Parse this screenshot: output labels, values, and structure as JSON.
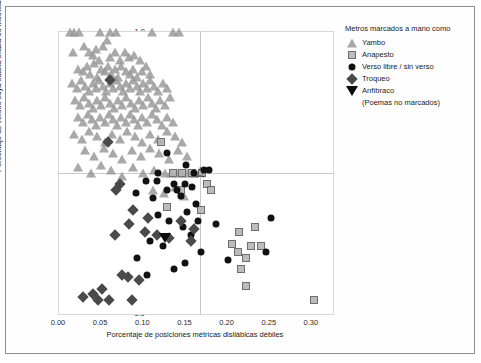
{
  "figure": {
    "background": "#ffffff",
    "frame_color": "#8c8c8c"
  },
  "legend": {
    "title": "Metros marcados a mano como",
    "note": "(Poemas no marcados)",
    "entries": [
      {
        "label": "Yambo",
        "marker": "triangle-up",
        "color": "#969696"
      },
      {
        "label": "Anapesto",
        "marker": "square",
        "color": "#b0b0b0"
      },
      {
        "label": "Verso libre / sin verso",
        "marker": "circle",
        "color": "#111111"
      },
      {
        "label": "Troqueo",
        "marker": "diamond",
        "color": "#4a4a4a"
      },
      {
        "label": "Anfíbraco",
        "marker": "triangle-down",
        "color": "#0c0c0c"
      }
    ]
  },
  "chart_data": {
    "type": "scatter",
    "title": "",
    "xlabel": "Porcentaje de posiciones métricas disilábicas débiles",
    "ylabel": "Porcentaje de versos cuya cuarta sílaba es métricamente fuerte",
    "xlim": [
      0.0,
      0.325
    ],
    "ylim": [
      0.0,
      1.0
    ],
    "xticks": [
      "0.00",
      "0.05",
      "0.10",
      "0.15",
      "0.20",
      "0.25",
      "0.30"
    ],
    "xtick_values": [
      0.0,
      0.05,
      0.1,
      0.15,
      0.2,
      0.25,
      0.3
    ],
    "yticks": [
      "0.0",
      "0.1",
      "0.2",
      "0.3",
      "0.4",
      "0.5",
      "0.6",
      "0.7",
      "0.8",
      "0.9",
      "1.0"
    ],
    "ytick_values": [
      0.0,
      0.1,
      0.2,
      0.3,
      0.4,
      0.5,
      0.6,
      0.7,
      0.8,
      0.9,
      1.0
    ],
    "grid": false,
    "legend_position": "right-outside",
    "reference_lines": {
      "x": 0.167,
      "y": 0.5,
      "color": "#c9c9c9"
    },
    "highlight_marker": {
      "shape": "star",
      "x": 0.167,
      "y": 0.5
    },
    "series": [
      {
        "name": "Yambo",
        "marker": "triangle-up",
        "color": "#969696",
        "points": [
          [
            0.013,
            1.0
          ],
          [
            0.018,
            1.0
          ],
          [
            0.024,
            1.0
          ],
          [
            0.049,
            1.0
          ],
          [
            0.061,
            1.0
          ],
          [
            0.068,
            1.0
          ],
          [
            0.11,
            1.0
          ],
          [
            0.135,
            1.0
          ],
          [
            0.142,
            1.0
          ],
          [
            0.017,
            0.93
          ],
          [
            0.03,
            0.95
          ],
          [
            0.035,
            0.93
          ],
          [
            0.04,
            0.92
          ],
          [
            0.044,
            0.94
          ],
          [
            0.048,
            0.9
          ],
          [
            0.052,
            0.95
          ],
          [
            0.057,
            0.97
          ],
          [
            0.06,
            0.91
          ],
          [
            0.066,
            0.93
          ],
          [
            0.072,
            0.9
          ],
          [
            0.078,
            0.93
          ],
          [
            0.083,
            0.91
          ],
          [
            0.089,
            0.92
          ],
          [
            0.096,
            0.9
          ],
          [
            0.022,
            0.87
          ],
          [
            0.028,
            0.86
          ],
          [
            0.033,
            0.88
          ],
          [
            0.037,
            0.85
          ],
          [
            0.041,
            0.89
          ],
          [
            0.045,
            0.84
          ],
          [
            0.05,
            0.87
          ],
          [
            0.054,
            0.86
          ],
          [
            0.058,
            0.88
          ],
          [
            0.062,
            0.85
          ],
          [
            0.066,
            0.87
          ],
          [
            0.07,
            0.84
          ],
          [
            0.074,
            0.88
          ],
          [
            0.079,
            0.86
          ],
          [
            0.084,
            0.85
          ],
          [
            0.088,
            0.87
          ],
          [
            0.093,
            0.84
          ],
          [
            0.098,
            0.86
          ],
          [
            0.103,
            0.88
          ],
          [
            0.108,
            0.85
          ],
          [
            0.015,
            0.82
          ],
          [
            0.021,
            0.8
          ],
          [
            0.026,
            0.83
          ],
          [
            0.031,
            0.81
          ],
          [
            0.036,
            0.79
          ],
          [
            0.04,
            0.82
          ],
          [
            0.044,
            0.8
          ],
          [
            0.048,
            0.83
          ],
          [
            0.052,
            0.81
          ],
          [
            0.056,
            0.79
          ],
          [
            0.06,
            0.82
          ],
          [
            0.064,
            0.8
          ],
          [
            0.068,
            0.83
          ],
          [
            0.072,
            0.81
          ],
          [
            0.076,
            0.79
          ],
          [
            0.08,
            0.82
          ],
          [
            0.084,
            0.8
          ],
          [
            0.088,
            0.83
          ],
          [
            0.092,
            0.81
          ],
          [
            0.096,
            0.79
          ],
          [
            0.1,
            0.82
          ],
          [
            0.104,
            0.8
          ],
          [
            0.108,
            0.83
          ],
          [
            0.113,
            0.81
          ],
          [
            0.118,
            0.79
          ],
          [
            0.123,
            0.82
          ],
          [
            0.128,
            0.8
          ],
          [
            0.019,
            0.76
          ],
          [
            0.025,
            0.74
          ],
          [
            0.03,
            0.77
          ],
          [
            0.035,
            0.75
          ],
          [
            0.04,
            0.73
          ],
          [
            0.045,
            0.76
          ],
          [
            0.05,
            0.74
          ],
          [
            0.055,
            0.77
          ],
          [
            0.06,
            0.75
          ],
          [
            0.065,
            0.73
          ],
          [
            0.07,
            0.76
          ],
          [
            0.075,
            0.74
          ],
          [
            0.08,
            0.77
          ],
          [
            0.085,
            0.75
          ],
          [
            0.09,
            0.73
          ],
          [
            0.095,
            0.76
          ],
          [
            0.1,
            0.74
          ],
          [
            0.105,
            0.77
          ],
          [
            0.11,
            0.75
          ],
          [
            0.115,
            0.73
          ],
          [
            0.12,
            0.76
          ],
          [
            0.126,
            0.74
          ],
          [
            0.132,
            0.77
          ],
          [
            0.023,
            0.7
          ],
          [
            0.029,
            0.68
          ],
          [
            0.034,
            0.71
          ],
          [
            0.039,
            0.69
          ],
          [
            0.044,
            0.67
          ],
          [
            0.049,
            0.7
          ],
          [
            0.054,
            0.68
          ],
          [
            0.059,
            0.71
          ],
          [
            0.064,
            0.69
          ],
          [
            0.069,
            0.67
          ],
          [
            0.074,
            0.7
          ],
          [
            0.079,
            0.68
          ],
          [
            0.084,
            0.71
          ],
          [
            0.089,
            0.69
          ],
          [
            0.094,
            0.67
          ],
          [
            0.099,
            0.7
          ],
          [
            0.104,
            0.68
          ],
          [
            0.11,
            0.71
          ],
          [
            0.116,
            0.69
          ],
          [
            0.122,
            0.67
          ],
          [
            0.128,
            0.7
          ],
          [
            0.135,
            0.68
          ],
          [
            0.018,
            0.64
          ],
          [
            0.027,
            0.62
          ],
          [
            0.036,
            0.65
          ],
          [
            0.045,
            0.63
          ],
          [
            0.054,
            0.61
          ],
          [
            0.063,
            0.64
          ],
          [
            0.072,
            0.62
          ],
          [
            0.081,
            0.65
          ],
          [
            0.09,
            0.63
          ],
          [
            0.099,
            0.61
          ],
          [
            0.108,
            0.64
          ],
          [
            0.118,
            0.62
          ],
          [
            0.128,
            0.65
          ],
          [
            0.138,
            0.63
          ],
          [
            0.146,
            0.61
          ],
          [
            0.031,
            0.58
          ],
          [
            0.042,
            0.56
          ],
          [
            0.053,
            0.59
          ],
          [
            0.064,
            0.57
          ],
          [
            0.075,
            0.55
          ],
          [
            0.086,
            0.58
          ],
          [
            0.097,
            0.56
          ],
          [
            0.108,
            0.59
          ],
          [
            0.119,
            0.57
          ],
          [
            0.13,
            0.55
          ],
          [
            0.141,
            0.58
          ],
          [
            0.152,
            0.56
          ],
          [
            0.022,
            0.52
          ],
          [
            0.038,
            0.5
          ],
          [
            0.05,
            0.53
          ],
          [
            0.062,
            0.51
          ],
          [
            0.075,
            0.49
          ],
          [
            0.088,
            0.52
          ],
          [
            0.1,
            0.5
          ],
          [
            0.113,
            0.51
          ],
          [
            0.126,
            0.5
          ],
          [
            0.14,
            0.5
          ],
          [
            0.152,
            0.5
          ],
          [
            0.16,
            0.5
          ],
          [
            0.112,
            0.44
          ],
          [
            0.125,
            0.43
          ],
          [
            0.137,
            0.45
          ],
          [
            0.148,
            0.42
          ],
          [
            0.159,
            0.5
          ],
          [
            0.146,
            0.5
          ],
          [
            0.133,
            0.5
          ]
        ]
      },
      {
        "name": "Anapesto",
        "marker": "square",
        "color": "#b0b0b0",
        "points": [
          [
            0.121,
            0.61
          ],
          [
            0.146,
            0.5
          ],
          [
            0.158,
            0.5
          ],
          [
            0.17,
            0.5
          ],
          [
            0.135,
            0.5
          ],
          [
            0.145,
            0.44
          ],
          [
            0.175,
            0.46
          ],
          [
            0.18,
            0.44
          ],
          [
            0.168,
            0.37
          ],
          [
            0.128,
            0.38
          ],
          [
            0.205,
            0.25
          ],
          [
            0.213,
            0.29
          ],
          [
            0.212,
            0.22
          ],
          [
            0.222,
            0.2
          ],
          [
            0.216,
            0.16
          ],
          [
            0.228,
            0.24
          ],
          [
            0.232,
            0.31
          ],
          [
            0.24,
            0.24
          ],
          [
            0.222,
            0.1
          ],
          [
            0.303,
            0.05
          ]
        ]
      },
      {
        "name": "Verso libre / sin verso",
        "marker": "circle",
        "color": "#111111",
        "points": [
          [
            0.128,
            0.57
          ],
          [
            0.151,
            0.53
          ],
          [
            0.118,
            0.5
          ],
          [
            0.16,
            0.5
          ],
          [
            0.172,
            0.51
          ],
          [
            0.178,
            0.51
          ],
          [
            0.103,
            0.47
          ],
          [
            0.116,
            0.47
          ],
          [
            0.128,
            0.44
          ],
          [
            0.14,
            0.44
          ],
          [
            0.15,
            0.46
          ],
          [
            0.158,
            0.45
          ],
          [
            0.091,
            0.43
          ],
          [
            0.112,
            0.41
          ],
          [
            0.136,
            0.46
          ],
          [
            0.145,
            0.42
          ],
          [
            0.163,
            0.39
          ],
          [
            0.152,
            0.36
          ],
          [
            0.118,
            0.35
          ],
          [
            0.131,
            0.33
          ],
          [
            0.147,
            0.31
          ],
          [
            0.165,
            0.33
          ],
          [
            0.108,
            0.26
          ],
          [
            0.123,
            0.24
          ],
          [
            0.156,
            0.28
          ],
          [
            0.168,
            0.22
          ],
          [
            0.186,
            0.32
          ],
          [
            0.15,
            0.18
          ],
          [
            0.136,
            0.16
          ],
          [
            0.2,
            0.19
          ],
          [
            0.252,
            0.34
          ],
          [
            0.245,
            0.22
          ],
          [
            0.093,
            0.2
          ],
          [
            0.104,
            0.14
          ]
        ]
      },
      {
        "name": "Troqueo",
        "marker": "diamond",
        "color": "#4a4a4a",
        "points": [
          [
            0.06,
            0.83
          ],
          [
            0.058,
            0.61
          ],
          [
            0.072,
            0.46
          ],
          [
            0.068,
            0.44
          ],
          [
            0.088,
            0.37
          ],
          [
            0.083,
            0.32
          ],
          [
            0.105,
            0.34
          ],
          [
            0.102,
            0.29
          ],
          [
            0.067,
            0.28
          ],
          [
            0.116,
            0.28
          ],
          [
            0.145,
            0.33
          ],
          [
            0.16,
            0.3
          ],
          [
            0.156,
            0.26
          ],
          [
            0.075,
            0.14
          ],
          [
            0.082,
            0.13
          ],
          [
            0.095,
            0.12
          ],
          [
            0.029,
            0.06
          ],
          [
            0.04,
            0.07
          ],
          [
            0.046,
            0.05
          ],
          [
            0.051,
            0.09
          ],
          [
            0.059,
            0.05
          ],
          [
            0.086,
            0.05
          ],
          [
            0.13,
            0.27
          ]
        ]
      },
      {
        "name": "Anfíbraco",
        "marker": "triangle-down",
        "color": "#0c0c0c",
        "points": [
          [
            0.126,
            0.27
          ]
        ]
      }
    ]
  }
}
